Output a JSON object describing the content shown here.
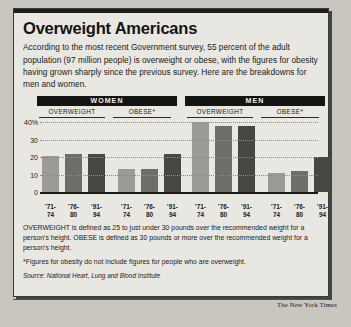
{
  "headline": "Overweight Americans",
  "intro": "According to the most recent Government survey, 55 percent of the adult population (97 million people) is overweight or obese, with the figures for obesity having grown sharply since the previous survey. Here are the breakdowns for men and women.",
  "groups": [
    {
      "label": "WOMEN"
    },
    {
      "label": "MEN"
    }
  ],
  "subheads": [
    "OVERWEIGHT",
    "OBESE*",
    "OVERWEIGHT",
    "OBESE*"
  ],
  "notes": {
    "definition": "OVERWEIGHT is defined as 25 to just under 30 pounds over the recommended weight for a person's height. OBESE is defined as 30 pounds or more over the recommended weight for a person's height.",
    "footnote": "*Figures for obesity do not include figures for people who are overweight.",
    "source": "Source: National Heart, Lung and Blood Institute"
  },
  "credit": "The New York Times",
  "chart_data": {
    "type": "bar",
    "title": "Overweight Americans",
    "xlabel": "",
    "ylabel": "",
    "ylim": [
      0,
      40
    ],
    "ytick_labels": [
      "0",
      "10",
      "20",
      "30",
      "40%"
    ],
    "ytick_values": [
      0,
      10,
      20,
      30,
      40
    ],
    "grid": true,
    "legend": "none",
    "categories": [
      "'71-74",
      "'76-80",
      "'91-94"
    ],
    "panels": [
      {
        "group": "WOMEN",
        "measure": "OVERWEIGHT",
        "values": [
          20.5,
          21.5,
          22.0
        ]
      },
      {
        "group": "WOMEN",
        "measure": "OBESE*",
        "values": [
          13.0,
          13.0,
          22.0
        ]
      },
      {
        "group": "MEN",
        "measure": "OVERWEIGHT",
        "values": [
          40.0,
          38.0,
          38.0
        ]
      },
      {
        "group": "MEN",
        "measure": "OBESE*",
        "values": [
          11.0,
          12.0,
          20.0
        ]
      }
    ],
    "bar_colors": [
      "#9b9a96",
      "#6e6d6a",
      "#474643"
    ]
  }
}
